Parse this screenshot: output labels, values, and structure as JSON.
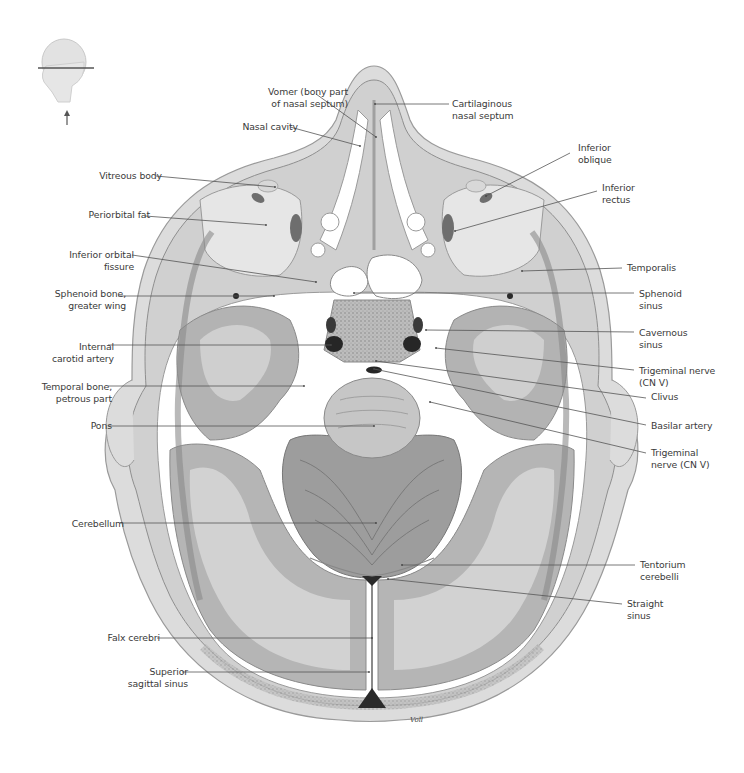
{
  "figure": {
    "orientation_icon": "head-profile-section-plane-icon",
    "colors": {
      "background": "#ffffff",
      "label_text": "#3a3a3a",
      "leader_line": "#555555",
      "skin": "#d9d9d9",
      "bone": "#cfcfcf",
      "grey_matter": "#a9a9a9",
      "white_matter": "#cdcdcd",
      "csf_space": "#ffffff",
      "sinus_dark": "#2a2a2a",
      "muscle": "#8a8a8a"
    }
  },
  "labels": [
    {
      "id": "vomer",
      "text": "Vomer (bony part\nof nasal septum)",
      "side": "right",
      "x": 230,
      "y": 86,
      "w": 108,
      "line": [
        [
          316,
          94
        ],
        [
          376,
          137
        ]
      ]
    },
    {
      "id": "nasal-cavity",
      "text": "Nasal cavity",
      "side": "right",
      "x": 228,
      "y": 121,
      "w": 60,
      "line": [
        [
          290,
          127
        ],
        [
          360,
          146
        ]
      ]
    },
    {
      "id": "cartilaginous-septum",
      "text": "Cartilaginous\nnasal septum",
      "side": "left",
      "x": 452,
      "y": 98,
      "w": 90,
      "line": [
        [
          449,
          104
        ],
        [
          375,
          104
        ]
      ]
    },
    {
      "id": "vitreous-body",
      "text": "Vitreous body",
      "side": "right",
      "x": 90,
      "y": 170,
      "w": 62,
      "line": [
        [
          156,
          176
        ],
        [
          275,
          187
        ]
      ]
    },
    {
      "id": "inferior-oblique",
      "text": "Inferior\noblique",
      "side": "left",
      "x": 578,
      "y": 142,
      "w": 60,
      "line": [
        [
          570,
          153
        ],
        [
          486,
          196
        ]
      ]
    },
    {
      "id": "inferior-rectus",
      "text": "Inferior\nrectus",
      "side": "left",
      "x": 602,
      "y": 182,
      "w": 60,
      "line": [
        [
          597,
          191
        ],
        [
          455,
          231
        ]
      ]
    },
    {
      "id": "periorbital-fat",
      "text": "Periorbital fat",
      "side": "right",
      "x": 80,
      "y": 209,
      "w": 60,
      "line": [
        [
          145,
          216
        ],
        [
          266,
          225
        ]
      ]
    },
    {
      "id": "inferior-orbital-fissure",
      "text": "Inferior orbital\nfissure",
      "side": "right",
      "x": 44,
      "y": 249,
      "w": 80,
      "line": [
        [
          132,
          255
        ],
        [
          316,
          282
        ]
      ]
    },
    {
      "id": "temporalis",
      "text": "Temporalis",
      "side": "left",
      "x": 627,
      "y": 262,
      "w": 60,
      "line": [
        [
          622,
          268
        ],
        [
          522,
          271
        ]
      ]
    },
    {
      "id": "sphenoid-greater-wing",
      "text": "Sphenoid bone,\ngreater wing",
      "side": "right",
      "x": 40,
      "y": 288,
      "w": 76,
      "line": [
        [
          118,
          296
        ],
        [
          274,
          296
        ]
      ]
    },
    {
      "id": "sphenoid-sinus",
      "text": "Sphenoid\nsinus",
      "side": "left",
      "x": 639,
      "y": 288,
      "w": 60,
      "line": [
        [
          634,
          293
        ],
        [
          354,
          293
        ]
      ]
    },
    {
      "id": "cavernous-sinus",
      "text": "Cavernous\nsinus",
      "side": "left",
      "x": 639,
      "y": 327,
      "w": 60,
      "line": [
        [
          634,
          332
        ],
        [
          426,
          330
        ]
      ]
    },
    {
      "id": "internal-carotid",
      "text": "Internal\ncarotid artery",
      "side": "right",
      "x": 40,
      "y": 341,
      "w": 64,
      "line": [
        [
          108,
          345
        ],
        [
          331,
          345
        ]
      ]
    },
    {
      "id": "trigeminal-upper",
      "text": "Trigeminal nerve\n(CN V)",
      "side": "left",
      "x": 639,
      "y": 365,
      "w": 80,
      "line": [
        [
          634,
          370
        ],
        [
          436,
          348
        ]
      ]
    },
    {
      "id": "clivus",
      "text": "Clivus",
      "side": "left",
      "x": 651,
      "y": 391,
      "w": 40,
      "line": [
        [
          646,
          398
        ],
        [
          376,
          361
        ]
      ]
    },
    {
      "id": "temporal-petrous",
      "text": "Temporal bone,\npetrous part",
      "side": "right",
      "x": 36,
      "y": 381,
      "w": 66,
      "line": [
        [
          108,
          386
        ],
        [
          304,
          386
        ]
      ]
    },
    {
      "id": "basilar-artery",
      "text": "Basilar artery",
      "side": "left",
      "x": 651,
      "y": 420,
      "w": 72,
      "line": [
        [
          646,
          425
        ],
        [
          374,
          369
        ]
      ]
    },
    {
      "id": "pons",
      "text": "Pons",
      "side": "right",
      "x": 60,
      "y": 420,
      "w": 42,
      "line": [
        [
          108,
          426
        ],
        [
          374,
          426
        ]
      ]
    },
    {
      "id": "trigeminal-lower",
      "text": "Trigeminal\nnerve (CN V)",
      "side": "left",
      "x": 651,
      "y": 447,
      "w": 72,
      "line": [
        [
          646,
          453
        ],
        [
          430,
          402
        ]
      ]
    },
    {
      "id": "cerebellum",
      "text": "Cerebellum",
      "side": "right",
      "x": 50,
      "y": 518,
      "w": 64,
      "line": [
        [
          120,
          523
        ],
        [
          376,
          523
        ]
      ]
    },
    {
      "id": "tentorium-cerebelli",
      "text": "Tentorium\ncerebelli",
      "side": "left",
      "x": 640,
      "y": 559,
      "w": 60,
      "line": [
        [
          635,
          565
        ],
        [
          402,
          565
        ]
      ]
    },
    {
      "id": "straight-sinus",
      "text": "Straight\nsinus",
      "side": "left",
      "x": 627,
      "y": 598,
      "w": 60,
      "line": [
        [
          622,
          604
        ],
        [
          388,
          579
        ]
      ]
    },
    {
      "id": "falx-cerebri",
      "text": "Falx cerebri",
      "side": "right",
      "x": 90,
      "y": 632,
      "w": 60,
      "line": [
        [
          157,
          638
        ],
        [
          372,
          638
        ]
      ]
    },
    {
      "id": "superior-sagittal-sinus",
      "text": "Superior\nsagittal sinus",
      "side": "right",
      "x": 110,
      "y": 666,
      "w": 68,
      "line": [
        [
          182,
          672
        ],
        [
          369,
          672
        ]
      ]
    }
  ],
  "orientation_arrow": "up-arrow-icon",
  "signature": "Voll"
}
